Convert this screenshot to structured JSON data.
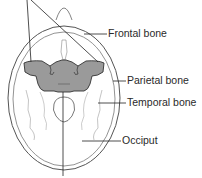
{
  "diagram": {
    "highlighted_bone": "sphenoid",
    "colors": {
      "outline": "#555555",
      "leader": "#222222",
      "highlight_fill": "#9a9a9a",
      "highlight_stroke": "#333333",
      "background": "#ffffff"
    },
    "labels": [
      {
        "id": "frontal",
        "text": "Frontal bone"
      },
      {
        "id": "parietal",
        "text": "Parietal bone"
      },
      {
        "id": "temporal",
        "text": "Temporal bone"
      },
      {
        "id": "occiput",
        "text": "Occiput"
      }
    ]
  }
}
